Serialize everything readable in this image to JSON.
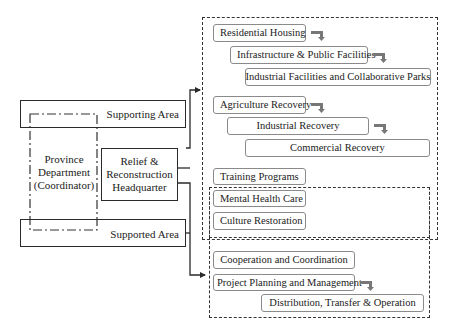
{
  "left": {
    "supporting_area": "Supporting Area",
    "supported_area": "Supported Area",
    "province_department": [
      "Province",
      "Department",
      "(Coordinator)"
    ],
    "headquarter": [
      "Relief &",
      "Reconstruction",
      "Headquarter"
    ]
  },
  "supporting_group": {
    "items": [
      {
        "label": "Residential Housing",
        "has_arrow": true
      },
      {
        "label": "Infrastructure & Public Facilities",
        "has_arrow": true
      },
      {
        "label": "Industrial Facilities and Collaborative Parks",
        "has_arrow": false
      },
      {
        "label": "Agriculture Recovery",
        "has_arrow": true
      },
      {
        "label": "Industrial Recovery",
        "has_arrow": true
      },
      {
        "label": "Commercial Recovery",
        "has_arrow": false
      },
      {
        "label": "Training Programs",
        "has_arrow": false
      }
    ]
  },
  "shared_group": {
    "items": [
      {
        "label": "Mental Health Care"
      },
      {
        "label": "Culture Restoration"
      }
    ]
  },
  "supported_group": {
    "items": [
      {
        "label": "Cooperation and Coordination",
        "has_arrow": false
      },
      {
        "label": "Project Planning and Management",
        "has_arrow": true
      },
      {
        "label": "Distribution, Transfer & Operation",
        "has_arrow": false
      }
    ]
  },
  "colors": {
    "line": "#2a2a2a",
    "box_border": "#8a8a8a",
    "arrow_gray": "#777777"
  }
}
